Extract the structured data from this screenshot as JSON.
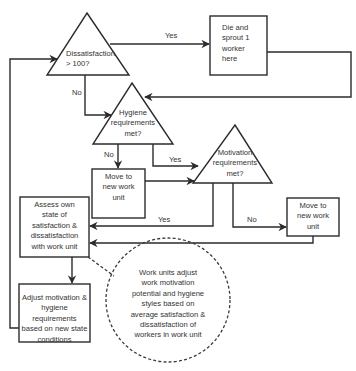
{
  "nodes": {
    "dissatisfaction": {
      "type": "decision",
      "text": "Dissatisfaction\n> 100?"
    },
    "die_sprout": {
      "type": "process",
      "text": "Die and\nsprout 1\nworker\nhere"
    },
    "hygiene": {
      "type": "decision",
      "text": "Hygiene\nrequirements\nmet?"
    },
    "move1": {
      "type": "process",
      "text": "Move to\nnew work\nunit"
    },
    "motivation": {
      "type": "decision",
      "text": "Motivation\nrequirements\nmet?"
    },
    "move2": {
      "type": "process",
      "text": "Move to\nnew work\nunit"
    },
    "assess": {
      "type": "process",
      "text": "Assess own\nstate of\nsatisfaction &\ndissatisfaction\nwith work unit"
    },
    "adjust": {
      "type": "process",
      "text": "Adjust motivation &\nhygiene requirements\nbased on new state\nconditions"
    },
    "work_units": {
      "type": "note",
      "text": "Work units adjust\nwork motivation\npotential and hygiene\nstyles based on\naverage satisfaction &\ndissatisfaction of\nworkers in work unit"
    }
  },
  "edges": {
    "dissatisfaction_yes": "Yes",
    "dissatisfaction_no": "No",
    "hygiene_no": "No",
    "hygiene_yes": "Yes",
    "motivation_yes": "Yes",
    "motivation_no": "No"
  },
  "colors": {
    "stroke": "#2b2b2b",
    "text": "#333333",
    "background": "#ffffff"
  }
}
